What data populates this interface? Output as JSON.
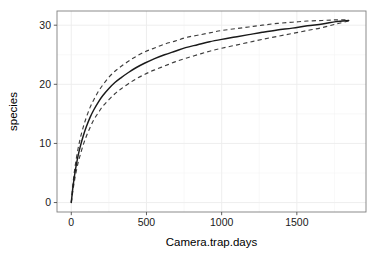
{
  "chart_data": {
    "type": "line",
    "title": "",
    "subtitle": "",
    "xlabel": "Camera.trap.days",
    "ylabel": "species",
    "xlim": [
      -95,
      1960
    ],
    "ylim": [
      -1.6,
      32.4
    ],
    "x_ticks": [
      0,
      500,
      1000,
      1500
    ],
    "y_ticks": [
      0,
      10,
      20,
      30
    ],
    "x_tick_labels": [
      "0",
      "500",
      "1000",
      "1500"
    ],
    "y_tick_labels": [
      "0",
      "10",
      "20",
      "30"
    ],
    "grid": true,
    "legend": "none",
    "annotations": [],
    "x": [
      0,
      10,
      20,
      30,
      45,
      60,
      80,
      100,
      125,
      150,
      180,
      210,
      250,
      290,
      330,
      380,
      430,
      490,
      550,
      620,
      690,
      760,
      840,
      920,
      1000,
      1090,
      1180,
      1270,
      1370,
      1470,
      1570,
      1670,
      1760,
      1845
    ],
    "series": [
      {
        "name": "species richness (mean)",
        "style": "solid",
        "color": "#1a1a1a",
        "values": [
          0.0,
          2.4,
          4.3,
          5.9,
          7.9,
          9.5,
          11.3,
          12.8,
          14.4,
          15.7,
          17.0,
          18.1,
          19.3,
          20.3,
          21.1,
          22.0,
          22.8,
          23.6,
          24.3,
          25.0,
          25.6,
          26.2,
          26.7,
          27.2,
          27.6,
          28.0,
          28.4,
          28.8,
          29.2,
          29.5,
          29.9,
          30.2,
          30.6,
          30.8
        ]
      },
      {
        "name": "upper 95% confidence bound",
        "style": "dashed",
        "color": "#3d3d3d",
        "values": [
          0.0,
          2.9,
          5.1,
          6.9,
          9.1,
          10.9,
          12.8,
          14.4,
          16.1,
          17.4,
          18.8,
          19.9,
          21.2,
          22.2,
          23.0,
          23.9,
          24.7,
          25.5,
          26.1,
          26.8,
          27.3,
          27.9,
          28.3,
          28.7,
          29.1,
          29.4,
          29.7,
          30.0,
          30.3,
          30.5,
          30.7,
          30.8,
          30.9,
          30.9
        ]
      },
      {
        "name": "lower 95% confidence bound",
        "style": "dashed",
        "color": "#3d3d3d",
        "values": [
          0.0,
          1.9,
          3.5,
          4.9,
          6.7,
          8.1,
          9.8,
          11.2,
          12.7,
          14.0,
          15.2,
          16.3,
          17.4,
          18.4,
          19.2,
          20.1,
          20.9,
          21.7,
          22.4,
          23.1,
          23.8,
          24.4,
          25.0,
          25.6,
          26.1,
          26.6,
          27.1,
          27.6,
          28.1,
          28.6,
          29.1,
          29.6,
          30.2,
          30.7
        ]
      }
    ]
  },
  "axes": {
    "x_title": "Camera.trap.days",
    "y_title": "species"
  }
}
